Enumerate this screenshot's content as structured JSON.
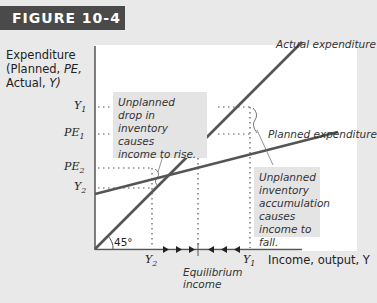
{
  "figure": {
    "tag": "FIGURE 10-4"
  },
  "axes": {
    "ylabel_line1": "Expenditure",
    "ylabel_line2_pre": "(Planned, ",
    "ylabel_line2_it": "PE,",
    "ylabel_line3_pre": "Actual, ",
    "ylabel_line3_it": "Y)",
    "xlabel": "Income, output, Y",
    "angle_label": "45°"
  },
  "y_ticks": [
    {
      "base": "Y",
      "sub": "1"
    },
    {
      "base": "PE",
      "sub": "1"
    },
    {
      "base": "PE",
      "sub": "2"
    },
    {
      "base": "Y",
      "sub": "2"
    }
  ],
  "x_ticks": [
    {
      "base": "Y",
      "sub": "2"
    },
    {
      "base": "Y",
      "sub": "1"
    }
  ],
  "equilibrium_label": [
    "Equilibrium",
    "income"
  ],
  "lines": {
    "actual": "Actual expenditure",
    "planned": "Planned expenditure"
  },
  "notes": {
    "left": [
      "Unplanned",
      "drop in",
      "inventory",
      "causes",
      "income to rise."
    ],
    "right": [
      "Unplanned",
      "inventory",
      "accumulation",
      "causes",
      "income to fall."
    ]
  },
  "colors": {
    "line": "#555555",
    "tag_bg": "#4a4a4a",
    "panel_bg": "#e9e9e9",
    "note_bg": "#e4e4e4"
  }
}
